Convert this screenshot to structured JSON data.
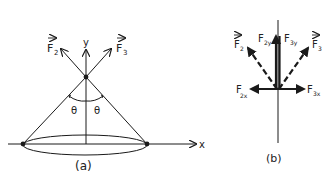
{
  "diagram_a": {
    "caption": "(a)",
    "labels": {
      "f2": "F",
      "f2_sub": "2",
      "f3": "F",
      "f3_sub": "3",
      "y_axis": "y",
      "x_axis": "x",
      "theta_left": "θ",
      "theta_right": "θ"
    }
  },
  "diagram_b": {
    "caption": "(b)",
    "labels": {
      "f2": "F",
      "f2_sub": "2",
      "f3": "F",
      "f3_sub": "3",
      "f2y": "F",
      "f2y_sub": "2y",
      "f3y": "F",
      "f3y_sub": "3y",
      "f2x": "F",
      "f2x_sub": "2x",
      "f3x": "F",
      "f3x_sub": "3x"
    }
  },
  "colors": {
    "ink": "#1a1a1a",
    "background": "#ffffff"
  }
}
